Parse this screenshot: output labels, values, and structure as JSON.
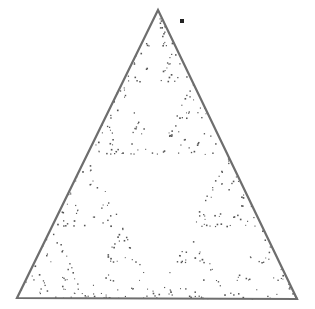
{
  "diagram": {
    "type": "chaos-game-sierpinski",
    "canvas": {
      "width": 315,
      "height": 309,
      "background": "#ffffff"
    },
    "triangle": {
      "vertices": [
        [
          158,
          10
        ],
        [
          17,
          298
        ],
        [
          297,
          299
        ]
      ],
      "stroke": "#6e6e6e",
      "stroke_width": 2.2
    },
    "marker": {
      "shape": "square",
      "x": 182,
      "y": 21,
      "size": 4,
      "color": "#222222"
    },
    "points": {
      "count": 420,
      "seed": 7,
      "burn_in": 12,
      "color": "#555555",
      "size": 1.2
    }
  }
}
